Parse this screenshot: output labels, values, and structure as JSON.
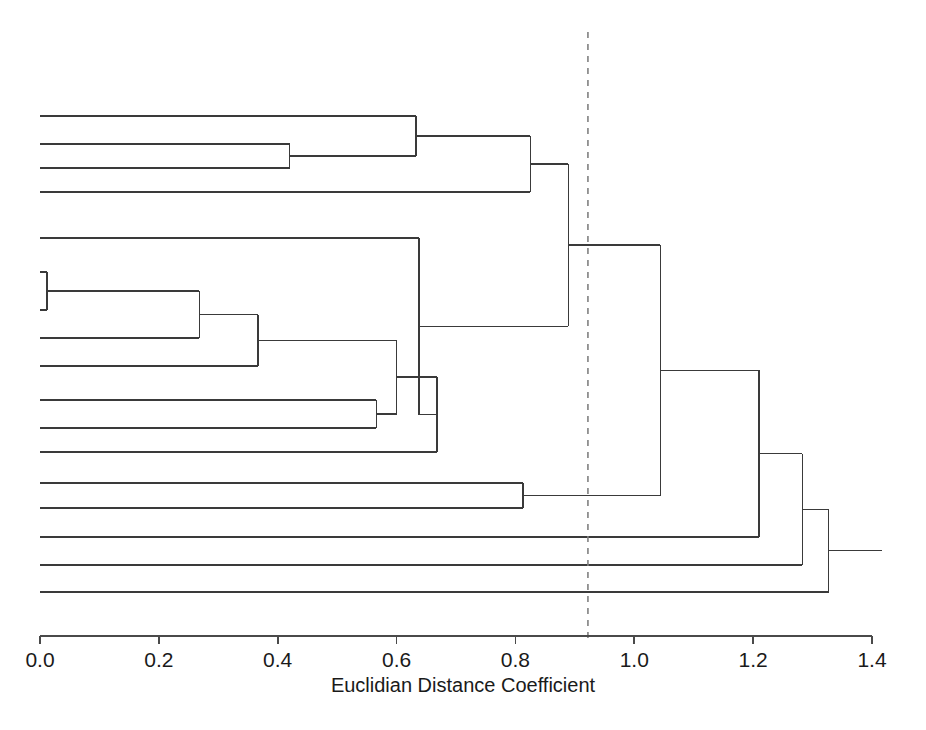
{
  "chart_data": {
    "type": "dendrogram",
    "title": "",
    "xlabel": "Euclidian Distance Coefficient",
    "ylabel": "",
    "xlim": [
      0.0,
      1.4
    ],
    "xticks": [
      0.0,
      0.2,
      0.4,
      0.6,
      0.8,
      1.0,
      1.2,
      1.4
    ],
    "xtick_labels": [
      "0.0",
      "0.2",
      "0.4",
      "0.6",
      "0.8",
      "1.0",
      "1.2",
      "1.4"
    ],
    "grid": false,
    "legend": "none",
    "orientation": "horizontal-left-to-right",
    "n_leaves": 15,
    "leaf_order": [
      1,
      2,
      3,
      4,
      5,
      6,
      7,
      8,
      9,
      10,
      11,
      12,
      13,
      14,
      15
    ],
    "leaf_y_px": [
      116,
      144,
      168,
      192,
      238,
      272,
      310,
      338,
      366,
      400,
      428,
      452,
      483,
      508,
      537,
      565,
      592
    ],
    "cut_line": {
      "value": 0.922,
      "style": "dashed",
      "color": "#808080",
      "label": ""
    },
    "line_color": "#3a3a3a",
    "background": "#ffffff",
    "merges": [
      {
        "id": "m1",
        "left": "leaf2",
        "right": "leaf3",
        "height": 0.42
      },
      {
        "id": "m2",
        "left": "leaf1",
        "right": "m1",
        "height": 0.633
      },
      {
        "id": "m3",
        "left": "m2",
        "right": "leaf4",
        "height": 0.825
      },
      {
        "id": "m4",
        "left": "leaf6",
        "right": "leaf7",
        "height": 0.012
      },
      {
        "id": "m5",
        "left": "m4",
        "right": "leaf8",
        "height": 0.268
      },
      {
        "id": "m6",
        "left": "m5",
        "right": "leaf9",
        "height": 0.367
      },
      {
        "id": "m7",
        "left": "leaf10",
        "right": "leaf11",
        "height": 0.566
      },
      {
        "id": "m8",
        "left": "m6",
        "right": "m7",
        "height": 0.6
      },
      {
        "id": "m9",
        "left": "m8",
        "right": "leaf12",
        "height": 0.668
      },
      {
        "id": "m10",
        "left": "leaf5",
        "right": "m9",
        "height": 0.638
      },
      {
        "id": "m11",
        "left": "leaf13",
        "right": "leaf14",
        "height": 0.813
      },
      {
        "id": "m12",
        "left": "m3",
        "right": "m10",
        "height": 0.889
      },
      {
        "id": "m13",
        "left": "m12",
        "right": "m11",
        "height": 1.044
      },
      {
        "id": "m14",
        "left": "m13",
        "right": "leaf15",
        "height": 1.21
      },
      {
        "id": "m15",
        "left": "m14",
        "right": "leaf16",
        "height": 1.283
      },
      {
        "id": "m16",
        "left": "m15",
        "right": "leaf17",
        "height": 1.327
      }
    ]
  },
  "axis": {
    "title": "Euclidian Distance Coefficient",
    "ticks": [
      {
        "label": "0.0",
        "value": 0.0
      },
      {
        "label": "0.2",
        "value": 0.2
      },
      {
        "label": "0.4",
        "value": 0.4
      },
      {
        "label": "0.6",
        "value": 0.6
      },
      {
        "label": "0.8",
        "value": 0.8
      },
      {
        "label": "1.0",
        "value": 1.0
      },
      {
        "label": "1.2",
        "value": 1.2
      },
      {
        "label": "1.4",
        "value": 1.4
      }
    ]
  }
}
